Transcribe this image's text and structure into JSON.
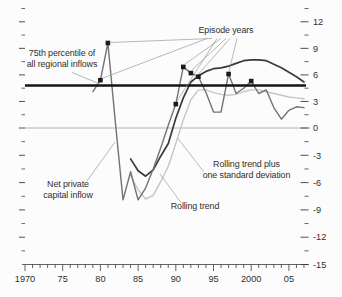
{
  "figure": {
    "background": "#fcfcfc",
    "text_color": "#2f2f2f",
    "annotations": [
      {
        "id": "pctile-label",
        "name": "75th-percentile-label",
        "lines": [
          "75th percentile of",
          "all regional inflows"
        ],
        "x": 62,
        "y": 56,
        "line_height": 10.8,
        "pointers": [
          [
            72,
            72.5,
            100,
            84
          ]
        ]
      },
      {
        "id": "episode-label",
        "name": "episode-years-label",
        "lines": [
          "Episode years"
        ],
        "x": 226,
        "y": 33,
        "line_height": 10.8,
        "pointers": [
          [
            207,
            38.5,
            103,
            78
          ],
          [
            212,
            38.5,
            109.5,
            42.5
          ],
          [
            217,
            38.5,
            177,
            101
          ],
          [
            221,
            38.5,
            184.5,
            64.5
          ],
          [
            226,
            38.5,
            191.5,
            70.5
          ],
          [
            230,
            38.5,
            198.5,
            74
          ],
          [
            237,
            38.5,
            229,
            71.5
          ]
        ]
      },
      {
        "id": "net-label",
        "name": "net-private-capital-inflow-label",
        "lines": [
          "Net private",
          "capital inflow"
        ],
        "x": 68,
        "y": 187,
        "line_height": 10.8,
        "pointers": [
          [
            87,
            181,
            115,
            142
          ]
        ]
      },
      {
        "id": "trendsd-label",
        "name": "rolling-trend-plus-sd-label",
        "lines": [
          "Rolling trend plus",
          "one standard deviation"
        ],
        "x": 246.5,
        "y": 167,
        "line_height": 10.8,
        "pointers": [
          [
            203.5,
            171.5,
            178,
            138.5
          ]
        ]
      },
      {
        "id": "trend-label",
        "name": "rolling-trend-label",
        "lines": [
          "Rolling trend"
        ],
        "x": 195,
        "y": 208.5,
        "line_height": 10.8,
        "pointers": [
          [
            181,
            202.5,
            160,
            174
          ]
        ]
      }
    ],
    "pointer_color": "#9a9a9a"
  },
  "chart_data": {
    "type": "line",
    "title": "",
    "xlabel": "",
    "ylabel": "",
    "x_axis": {
      "range": [
        1969.5,
        2007.8
      ],
      "major_ticks": [
        1970,
        1975,
        1980,
        1985,
        1990,
        1995,
        2000,
        2005
      ],
      "major_labels": [
        "1970",
        "75",
        "80",
        "85",
        "90",
        "95",
        "2000",
        "05"
      ],
      "minor_tick_years_start": 1970,
      "minor_tick_years_end": 2007
    },
    "y_axis": {
      "side": "right",
      "range": [
        -15,
        13.5
      ],
      "major_ticks": [
        12,
        9,
        6,
        3,
        0,
        -3,
        -6,
        -9,
        -12,
        -15
      ],
      "major_labels": [
        "12",
        "9",
        "6",
        "3",
        "0",
        "-3",
        "-6",
        "-9",
        "-12",
        "-15"
      ],
      "minor_ticks": [
        13.5,
        10.5,
        7.5,
        4.5,
        1.5,
        -1.5,
        -4.5,
        -7.5,
        -10.5,
        -13.5
      ]
    },
    "grid": false,
    "legend": "annotated-with-pointer-lines",
    "reference_lines": [
      {
        "name": "75th percentile of all regional inflows",
        "value": 4.8,
        "color": "#151515",
        "width": 2.6
      },
      {
        "name": "zero line",
        "value": 0,
        "color": "#a9a9a9",
        "width": 0.9
      }
    ],
    "series": [
      {
        "name": "Rolling trend",
        "color": "#c6c6c6",
        "width": 1.4,
        "x": [
          1984,
          1985,
          1986,
          1987,
          1988,
          1989,
          1990,
          1991,
          1992,
          1993,
          1994,
          1995,
          1996,
          1997,
          1998,
          1999,
          2000,
          2001,
          2002,
          2003,
          2004,
          2005,
          2006,
          2007
        ],
        "values": [
          -5.2,
          -6.8,
          -7.8,
          -7.4,
          -5.9,
          -4.2,
          -1.7,
          0.9,
          3.2,
          4.3,
          4.3,
          4.0,
          3.8,
          3.7,
          3.8,
          4.1,
          4.3,
          4.3,
          4.1,
          3.9,
          3.7,
          3.5,
          3.4,
          3.3
        ]
      },
      {
        "name": "Rolling trend plus one standard deviation",
        "color": "#3a3a3a",
        "width": 1.7,
        "x": [
          1984,
          1985,
          1986,
          1987,
          1988,
          1989,
          1990,
          1991,
          1992,
          1993,
          1994,
          1995,
          1996,
          1997,
          1998,
          1999,
          2000,
          2001,
          2002,
          2003,
          2004,
          2005,
          2006,
          2007
        ],
        "values": [
          -3.4,
          -4.7,
          -5.3,
          -4.6,
          -3.1,
          -1.7,
          1.1,
          3.4,
          5.2,
          5.9,
          6.4,
          6.7,
          6.8,
          7.0,
          7.3,
          7.6,
          7.7,
          7.7,
          7.6,
          7.2,
          6.8,
          6.3,
          5.8,
          5.2
        ]
      },
      {
        "name": "Net private capital inflow",
        "color": "#737373",
        "width": 1.4,
        "x": [
          1979,
          1980,
          1981,
          1982,
          1983,
          1984,
          1985,
          1986,
          1987,
          1988,
          1989,
          1990,
          1991,
          1992,
          1993,
          1994,
          1995,
          1996,
          1997,
          1998,
          1999,
          2000,
          2001,
          2002,
          2003,
          2004,
          2005,
          2006,
          2007
        ],
        "values": [
          4.1,
          5.4,
          9.6,
          0.5,
          -7.9,
          -4.8,
          -7.9,
          -6.6,
          -4.5,
          -2.2,
          0.3,
          2.7,
          6.9,
          6.2,
          5.8,
          4.0,
          1.8,
          1.8,
          6.1,
          3.9,
          4.5,
          5.3,
          3.9,
          4.3,
          2.3,
          1.0,
          2.0,
          2.4,
          2.3
        ]
      }
    ],
    "episode_markers": {
      "name": "Episode years",
      "marker": "square",
      "size": 4.6,
      "color": "#1a1a1a",
      "points": [
        [
          1980,
          5.4
        ],
        [
          1981,
          9.6
        ],
        [
          1990,
          2.7
        ],
        [
          1991,
          6.9
        ],
        [
          1992,
          6.2
        ],
        [
          1993,
          5.8
        ],
        [
          1997,
          6.1
        ],
        [
          2000,
          5.3
        ]
      ]
    }
  }
}
